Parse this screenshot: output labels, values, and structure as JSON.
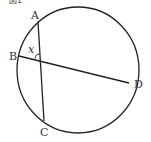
{
  "figure": {
    "caption": "図1",
    "points": {
      "A": {
        "label": "A",
        "x": 38,
        "y": 22
      },
      "B": {
        "label": "B",
        "x": 19,
        "y": 56
      },
      "C": {
        "label": "C",
        "x": 44,
        "y": 121
      },
      "D": {
        "label": "D",
        "x": 129,
        "y": 83
      }
    },
    "angle_label": "x",
    "chords": [
      "AC",
      "BD"
    ],
    "colors": {
      "stroke": "#222222",
      "text": "#333333",
      "background": "#ffffff"
    }
  }
}
